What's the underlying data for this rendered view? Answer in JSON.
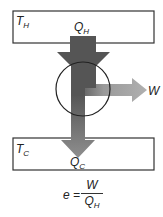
{
  "diagram": {
    "type": "heat-engine",
    "hot_reservoir": {
      "label": "T",
      "subscript": "H"
    },
    "cold_reservoir": {
      "label": "T",
      "subscript": "C"
    },
    "heat_in": {
      "label": "Q",
      "subscript": "H"
    },
    "heat_out": {
      "label": "Q",
      "subscript": "C"
    },
    "work_out": {
      "label": "W"
    },
    "efficiency": {
      "lhs": "e",
      "equals": "=",
      "numerator": "W",
      "denominator": "Q",
      "denominator_subscript": "H"
    },
    "colors": {
      "hot_arrow": "#555555",
      "cold_arrow": "#8a8a8a",
      "work_arrow": "#a8a8a8",
      "outline": "#333333"
    }
  }
}
